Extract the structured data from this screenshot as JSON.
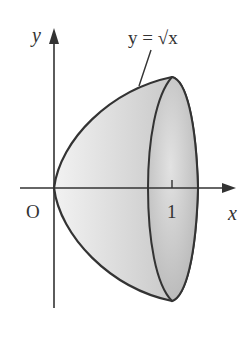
{
  "diagram": {
    "axes": {
      "x_label": "x",
      "y_label": "y",
      "origin_label": "O",
      "tick_label": "1"
    },
    "curve_label": "y = √x",
    "colors": {
      "stroke": "#333333",
      "fill_light": "#ececec",
      "fill_dark": "#b8b8b8",
      "background": "#ffffff"
    }
  }
}
